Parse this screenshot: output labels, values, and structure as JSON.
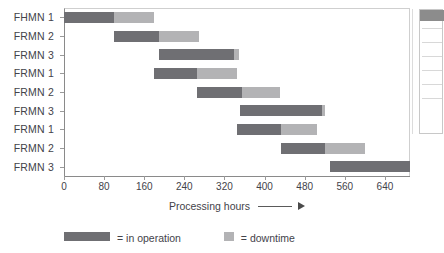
{
  "chart_data": {
    "type": "bar",
    "subtype": "gantt",
    "title": "",
    "xlabel": "Processing hours",
    "ylabel": "",
    "xlim": [
      0,
      690
    ],
    "xticks": [
      0,
      80,
      160,
      240,
      320,
      400,
      480,
      560,
      640
    ],
    "grid": false,
    "legend_position": "bottom",
    "categories": [
      "FHMN 1",
      "FRMN 2",
      "FRMN 3",
      "FRMN 1",
      "FRMN 2",
      "FRMN 3",
      "FRMN 1",
      "FRMN 2",
      "FRMN 3"
    ],
    "series": [
      {
        "name": "in operation",
        "color": "#6f6f73",
        "values": [
          100,
          90,
          150,
          85,
          90,
          165,
          87,
          88,
          160
        ]
      },
      {
        "name": "downtime",
        "color": "#b3b3b5",
        "values": [
          80,
          80,
          10,
          80,
          75,
          5,
          73,
          80,
          0
        ]
      }
    ],
    "tasks": [
      {
        "label": "FHMN 1",
        "start": 0,
        "operation_end": 100,
        "downtime_end": 180
      },
      {
        "label": "FRMN 2",
        "start": 100,
        "operation_end": 190,
        "downtime_end": 270
      },
      {
        "label": "FRMN 3",
        "start": 190,
        "operation_end": 340,
        "downtime_end": 350
      },
      {
        "label": "FRMN 1",
        "start": 180,
        "operation_end": 265,
        "downtime_end": 345
      },
      {
        "label": "FRMN 2",
        "start": 265,
        "operation_end": 355,
        "downtime_end": 430
      },
      {
        "label": "FRMN 3",
        "start": 350,
        "operation_end": 515,
        "downtime_end": 520
      },
      {
        "label": "FRMN 1",
        "start": 345,
        "operation_end": 432,
        "downtime_end": 505
      },
      {
        "label": "FRMN 2",
        "start": 432,
        "operation_end": 520,
        "downtime_end": 600
      },
      {
        "label": "FRMN 3",
        "start": 530,
        "operation_end": 690,
        "downtime_end": 690
      }
    ]
  },
  "axis": {
    "caption": "Processing hours",
    "tick_labels": [
      "0",
      "80",
      "160",
      "240",
      "320",
      "400",
      "480",
      "560",
      "640"
    ]
  },
  "legend": {
    "operation_label": "= in operation",
    "downtime_label": "= downtime"
  },
  "colors": {
    "operation": "#6f6f73",
    "downtime": "#b3b3b5",
    "axis": "#8a8a8a",
    "text": "#43434a"
  }
}
